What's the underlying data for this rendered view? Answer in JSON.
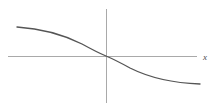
{
  "figure": {
    "name": "sigmoid-plot",
    "background_color": "#ffffff",
    "width": 217,
    "height": 111
  },
  "chart_data": {
    "type": "line",
    "title": "",
    "subtitle": "",
    "xlabel": "x",
    "ylabel": "",
    "legend": [],
    "annotations": [],
    "grid": false,
    "legend_position": "none",
    "axes": {
      "x_axis": {
        "label": "x",
        "label_style": "italic",
        "color": "#a9a9a9",
        "line_width": 1,
        "pixel_y": 56,
        "pixel_x_start": 8,
        "pixel_x_end": 197,
        "tick_labels": [],
        "ticks_visible": false
      },
      "y_axis": {
        "label": "",
        "color": "#a9a9a9",
        "line_width": 1,
        "pixel_x": 106,
        "pixel_y_start": 9,
        "pixel_y_end": 103,
        "tick_labels": [],
        "ticks_visible": false
      },
      "origin_pixel": [
        106,
        56
      ],
      "xlim": [
        -6,
        6
      ],
      "ylim": [
        -1.1,
        1.1
      ]
    },
    "series": [
      {
        "name": "decreasing-sigmoid",
        "color": "#555555",
        "line_width": 1.35,
        "description": "monotonically decreasing S-shaped curve through the origin",
        "x": [
          -5.8,
          -5.2,
          -4.6,
          -4.0,
          -3.4,
          -2.8,
          -2.2,
          -1.6,
          -1.0,
          -0.4,
          0.0,
          0.4,
          1.0,
          1.6,
          2.2,
          2.8,
          3.4,
          4.0,
          4.6,
          5.2,
          5.8,
          6.2
        ],
        "y": [
          0.952,
          0.945,
          0.935,
          0.921,
          0.899,
          0.866,
          0.818,
          0.747,
          0.636,
          0.29,
          0.0,
          -0.29,
          -0.636,
          -0.747,
          -0.818,
          -0.866,
          -0.899,
          -0.921,
          -0.935,
          -0.945,
          -0.952,
          -0.956
        ],
        "pixel_points": [
          [
            17,
            27
          ],
          [
            24,
            27.5
          ],
          [
            32,
            28.5
          ],
          [
            40,
            30
          ],
          [
            48,
            32
          ],
          [
            56,
            34
          ],
          [
            64,
            36.5
          ],
          [
            72,
            39.5
          ],
          [
            80,
            43
          ],
          [
            88,
            46.5
          ],
          [
            96,
            50.5
          ],
          [
            106,
            56
          ],
          [
            116,
            61.5
          ],
          [
            124,
            65.5
          ],
          [
            132,
            69
          ],
          [
            140,
            72
          ],
          [
            148,
            74.5
          ],
          [
            156,
            76.5
          ],
          [
            164,
            78.5
          ],
          [
            172,
            80
          ],
          [
            180,
            81.5
          ],
          [
            188,
            82.8
          ],
          [
            196,
            83.7
          ],
          [
            200,
            84
          ]
        ],
        "svg_path": "M 17,27 C 40,28.5 62,34 82,44 C 92,49.5 100,53.5 106,56 C 112,58.5 120,62.5 130,68 C 150,78 172,83 200,84"
      }
    ]
  },
  "labels": {
    "x_axis_label": "x"
  },
  "colors": {
    "axis": "#a9a9a9",
    "curve": "#555555",
    "label_text": "#4a4a4a",
    "background": "#ffffff"
  }
}
